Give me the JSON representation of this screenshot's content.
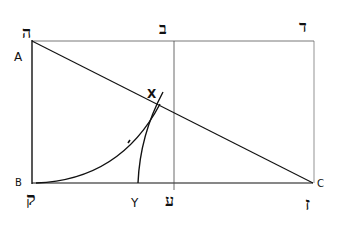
{
  "diagram": {
    "points": {
      "A": {
        "label": "A",
        "hebrew": "ה"
      },
      "B": {
        "label": "B",
        "hebrew": "ק"
      },
      "C": {
        "label": "C",
        "hebrew": "ז"
      },
      "X": {
        "label": "X"
      },
      "Y": {
        "label": "Y"
      },
      "top_middle": {
        "hebrew": "ב"
      },
      "top_right": {
        "hebrew": "ד"
      },
      "bottom_middle": {
        "hebrew": "ע"
      }
    },
    "lines": [
      {
        "name": "top-edge",
        "from": "A",
        "to": "top_right",
        "style": "thin"
      },
      {
        "name": "left-edge",
        "from": "A",
        "to": "B"
      },
      {
        "name": "bottom-edge",
        "from": "B",
        "to": "C"
      },
      {
        "name": "right-edge",
        "from": "top_right",
        "to": "C",
        "style": "thin"
      },
      {
        "name": "middle-vertical",
        "from": "top_middle",
        "to": "bottom_middle",
        "style": "thin"
      },
      {
        "name": "diagonal",
        "from": "A",
        "to": "C"
      }
    ],
    "curves": [
      {
        "name": "arc-from-B",
        "from": "B",
        "to": "X"
      },
      {
        "name": "curve-from-Y",
        "from": "Y",
        "to": "X"
      }
    ],
    "colors": {
      "ink": "#111111",
      "background": "#ffffff"
    }
  }
}
